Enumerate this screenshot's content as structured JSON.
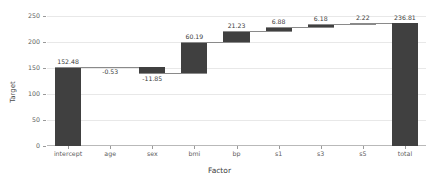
{
  "chart_data": {
    "type": "bar",
    "subtype": "waterfall",
    "title": "",
    "xlabel": "Factor",
    "ylabel": "Target",
    "ylim": [
      0,
      250
    ],
    "yticks": [
      0,
      50,
      100,
      150,
      200,
      250
    ],
    "ytick_labels": [
      "0",
      "50",
      "100",
      "150",
      "200",
      "250"
    ],
    "grid": true,
    "legend": false,
    "categories": [
      "intercept",
      "age",
      "sex",
      "bmi",
      "bp",
      "s1",
      "s3",
      "s5",
      "total"
    ],
    "values": [
      152.48,
      -0.53,
      -11.85,
      60.19,
      21.23,
      6.88,
      6.18,
      2.22,
      236.81
    ],
    "data_labels": [
      "152.48",
      "-0.53",
      "-11.85",
      "60.19",
      "21.23",
      "6.88",
      "6.18",
      "2.22",
      "236.81"
    ],
    "cumulative": [
      152.48,
      151.95,
      140.1,
      200.29,
      221.52,
      228.4,
      234.58,
      236.81,
      236.81
    ],
    "bar_base": [
      0,
      151.95,
      140.1,
      140.1,
      200.29,
      221.52,
      228.4,
      234.59,
      0
    ],
    "bar_top": [
      152.48,
      152.48,
      151.95,
      200.29,
      221.52,
      228.4,
      234.58,
      236.81,
      236.81
    ],
    "is_total": [
      true,
      false,
      false,
      false,
      false,
      false,
      false,
      false,
      true
    ],
    "bar_color": "#404040",
    "grid_color": "#e8e8e8",
    "axis_color": "#9a9a9a",
    "background_color": "#ffffff"
  }
}
